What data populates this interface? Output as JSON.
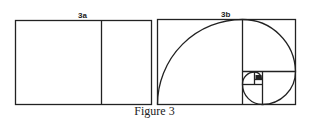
{
  "figure": {
    "caption": "Figure 3",
    "panels": [
      {
        "label": "3a",
        "description": "Golden rectangle divided into a square and a smaller rectangle"
      },
      {
        "label": "3b",
        "description": "Golden rectangle with nested squares and golden spiral"
      }
    ]
  }
}
